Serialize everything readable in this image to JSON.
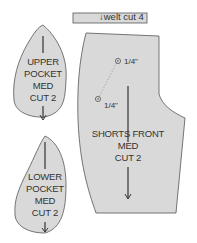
{
  "diagram": {
    "colors": {
      "fill": "#d9d9d9",
      "stroke": "#555555",
      "text": "#333333"
    },
    "welt": {
      "label": "welt cut 4",
      "arrow": "↓"
    },
    "upper_pocket": {
      "lines": [
        "UPPER",
        "POCKET",
        "MED",
        "CUT 2"
      ]
    },
    "lower_pocket": {
      "lines": [
        "LOWER",
        "POCKET",
        "MED",
        "CUT 2"
      ]
    },
    "shorts_front": {
      "lines": [
        "SHORTS FRONT",
        "MED",
        "CUT 2"
      ],
      "marks": [
        {
          "label": "1/4\""
        },
        {
          "label": "1/4\""
        }
      ]
    }
  }
}
